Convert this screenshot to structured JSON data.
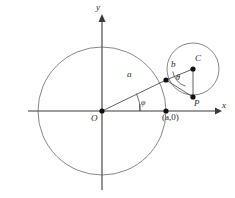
{
  "figure": {
    "kind": "geometry-diagram",
    "background_color": "#ffffff",
    "stroke_color": "#3a3a3a",
    "curve_color": "#555555"
  },
  "axes": {
    "x_label": "x",
    "y_label": "y",
    "origin_label": "O"
  },
  "labels": {
    "radius_a": "a",
    "radius_b": "b",
    "center_small_circle": "C",
    "tracing_point": "P",
    "angle_phi": "φ",
    "angle_theta": "θ",
    "point_a_zero": "(a,0)"
  },
  "geometry": {
    "big_circle": {
      "cx": 102,
      "cy": 111,
      "r": 64
    },
    "small_circle": {
      "cx": 193,
      "cy": 69,
      "r": 26
    },
    "origin": {
      "x": 102,
      "y": 111
    },
    "tangent_point": {
      "x": 166,
      "y": 80
    },
    "point_P": {
      "x": 193,
      "y": 97
    },
    "point_a_zero": {
      "x": 166,
      "y": 111
    },
    "x_axis": {
      "x1": 28,
      "y1": 111,
      "x2": 220,
      "y2": 111
    },
    "y_axis": {
      "x1": 102,
      "y1": 15,
      "x2": 102,
      "y2": 190
    }
  },
  "label_positions": {
    "x_label": {
      "x": 222,
      "y": 106
    },
    "y_label": {
      "x": 97,
      "y": 6
    },
    "origin": {
      "x": 92,
      "y": 115
    },
    "radius_a": {
      "x": 129,
      "y": 74
    },
    "radius_b": {
      "x": 172,
      "y": 63
    },
    "center_C": {
      "x": 195,
      "y": 57
    },
    "point_P": {
      "x": 194,
      "y": 99
    },
    "angle_phi": {
      "x": 142,
      "y": 101
    },
    "angle_theta": {
      "x": 177,
      "y": 77
    },
    "point_a_zero": {
      "x": 163,
      "y": 114
    }
  }
}
